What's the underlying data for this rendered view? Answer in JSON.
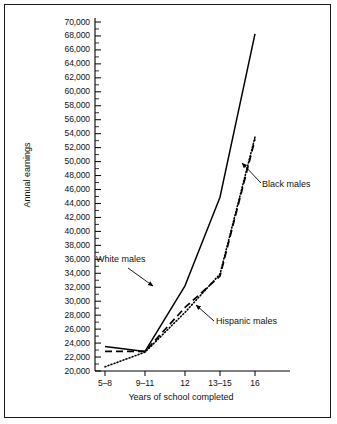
{
  "chart_data": {
    "type": "line",
    "title": "",
    "xlabel": "Years of school completed",
    "ylabel": "Annual earnings",
    "categories": [
      "5–8",
      "9–11",
      "12",
      "13–15",
      "16"
    ],
    "ylim": [
      20000,
      70000
    ],
    "ytick_step": 2000,
    "yticks": [
      "20,000",
      "22,000",
      "24,000",
      "26,000",
      "28,000",
      "30,000",
      "32,000",
      "34,000",
      "36,000",
      "38,000",
      "40,000",
      "42,000",
      "44,000",
      "46,000",
      "48,000",
      "50,000",
      "52,000",
      "54,000",
      "56,000",
      "58,000",
      "60,000",
      "62,000",
      "64,000",
      "66,000",
      "68,000",
      "70,000"
    ],
    "ytick_values": [
      20000,
      22000,
      24000,
      26000,
      28000,
      30000,
      32000,
      34000,
      36000,
      38000,
      40000,
      42000,
      44000,
      46000,
      48000,
      50000,
      52000,
      54000,
      56000,
      58000,
      60000,
      62000,
      64000,
      66000,
      68000,
      70000
    ],
    "grid": false,
    "legend_position": "inline-annotations",
    "series": [
      {
        "name": "White males",
        "style": "solid",
        "color": "#000000",
        "values": [
          23500,
          22800,
          32200,
          44900,
          68300
        ]
      },
      {
        "name": "Black males",
        "style": "dashed",
        "color": "#000000",
        "values": [
          22800,
          22800,
          29100,
          33600,
          53200
        ]
      },
      {
        "name": "Hispanic males",
        "style": "dotted",
        "color": "#000000",
        "values": [
          20600,
          22700,
          28400,
          33900,
          53500
        ]
      }
    ],
    "annotations": [
      {
        "text": "White males",
        "series": "White males"
      },
      {
        "text": "Black males",
        "series": "Black males"
      },
      {
        "text": "Hispanic males",
        "series": "Hispanic males"
      }
    ]
  },
  "axes": {
    "y_title": "Annual earnings",
    "x_title": "Years of school completed"
  },
  "annotations": {
    "white": "White males",
    "black": "Black males",
    "hispanic": "Hispanic males"
  },
  "colors": {
    "ink": "#000000",
    "frame": "#1a1a1a",
    "background": "#ffffff"
  }
}
